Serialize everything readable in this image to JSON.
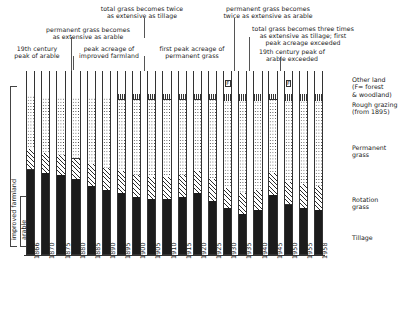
{
  "chart_data": {
    "type": "bar",
    "title": "",
    "subtitle": "",
    "xlabel": "",
    "ylabel": "",
    "ylim": [
      0,
      100
    ],
    "grid": false,
    "legend_position": "right",
    "stacked": true,
    "normalized_percent": true,
    "categories": [
      "1866",
      "1870",
      "1875",
      "1880",
      "1885",
      "1890",
      "1895",
      "1900",
      "1905",
      "1910",
      "1915",
      "1920",
      "1925",
      "1930",
      "1935",
      "1940",
      "1945",
      "1950",
      "1955",
      "1958"
    ],
    "series": [
      {
        "name": "Tillage",
        "values": [
          46,
          44,
          43,
          41,
          37,
          35,
          33,
          31,
          30,
          30,
          31,
          33,
          29,
          25,
          22,
          24,
          32,
          27,
          25,
          24
        ]
      },
      {
        "name": "Rotation grass",
        "values": [
          11,
          11,
          11,
          11,
          12,
          12,
          12,
          12,
          12,
          12,
          12,
          12,
          12,
          11,
          11,
          11,
          12,
          12,
          13,
          13
        ]
      },
      {
        "name": "Permanent grass",
        "values": [
          29,
          30,
          31,
          33,
          36,
          38,
          39,
          41,
          42,
          42,
          41,
          39,
          43,
          47,
          50,
          48,
          40,
          44,
          45,
          46
        ]
      },
      {
        "name": "Rough grazing",
        "values": [
          0,
          0,
          0,
          0,
          0,
          0,
          3,
          3,
          3,
          3,
          3,
          3,
          3,
          4,
          4,
          4,
          3,
          4,
          4,
          4
        ]
      },
      {
        "name": "Other land",
        "values": [
          14,
          15,
          15,
          15,
          15,
          15,
          13,
          13,
          13,
          13,
          13,
          13,
          13,
          13,
          13,
          13,
          13,
          13,
          13,
          13
        ]
      }
    ],
    "forest_markers": [
      "1930",
      "1950"
    ]
  },
  "annotations": [
    {
      "id": "a1",
      "text": "19th century\npeak of arable",
      "target_year": "1866"
    },
    {
      "id": "a2",
      "text": "permanent grass becomes\nas extensive as arable",
      "target_year": "1880"
    },
    {
      "id": "a3",
      "text": "peak acreage of\nimproved farmland",
      "target_year": "1885"
    },
    {
      "id": "a4",
      "text": "total grass becomes twice\nas extensive as tillage",
      "target_year": "1900"
    },
    {
      "id": "a5",
      "text": "first peak acreage of\npermanent grass",
      "target_year": "1910"
    },
    {
      "id": "a6",
      "text": "permanent grass becomes\ntwice as extensive as arable",
      "target_year": "1925"
    },
    {
      "id": "a7",
      "text": "total grass becomes three times\nas extensive as tillage; first\npeak acreage exceeded",
      "target_year": "1930"
    },
    {
      "id": "a8",
      "text": "19th century peak of\narable exceeded",
      "target_year": "1940"
    }
  ],
  "legend": {
    "items": [
      {
        "key": "other",
        "label": "Other land\n(F= forest\n& woodland)"
      },
      {
        "key": "rough",
        "label": "Rough grazing\n(from 1895)"
      },
      {
        "key": "perm",
        "label": "Permanent\ngrass"
      },
      {
        "key": "rot",
        "label": "Rotation\ngrass"
      },
      {
        "key": "till",
        "label": "Tillage"
      }
    ]
  },
  "left_brackets": [
    {
      "key": "improved",
      "label": "improved farmland"
    },
    {
      "key": "arable",
      "label": "arable"
    }
  ],
  "marker_label": "F"
}
